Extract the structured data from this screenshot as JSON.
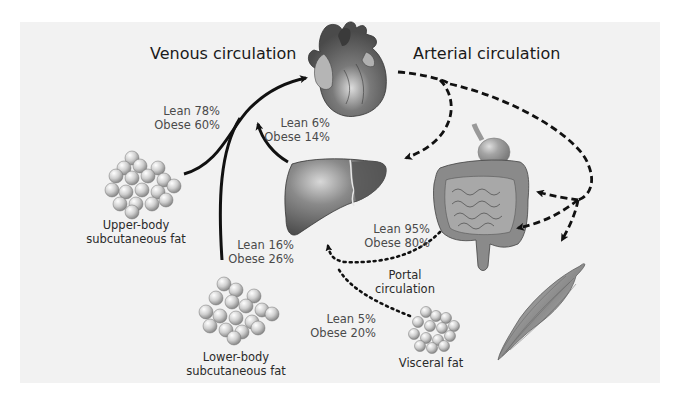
{
  "titles": {
    "venous": "Venous circulation",
    "arterial": "Arterial circulation"
  },
  "organs": {
    "heart": "heart",
    "liver": "liver",
    "gut": "stomach and intestines",
    "muscle": "skeletal muscle"
  },
  "depots": {
    "upper": {
      "line1": "Upper-body",
      "line2": "subcutaneous fat"
    },
    "lower": {
      "line1": "Lower-body",
      "line2": "subcutaneous fat"
    },
    "visceral": {
      "line1": "Visceral fat"
    }
  },
  "flows": {
    "upper_to_heart": {
      "lean": "Lean 78%",
      "obese": "Obese 60%"
    },
    "liver_to_heart": {
      "lean": "Lean 6%",
      "obese": "Obese 14%"
    },
    "lower_to_heart": {
      "lean": "Lean 16%",
      "obese": "Obese 26%"
    },
    "gut_to_liver": {
      "lean": "Lean 95%",
      "obese": "Obese 80%"
    },
    "visceral_to_liver": {
      "lean": "Lean 5%",
      "obese": "Obese 20%"
    }
  },
  "portal": {
    "line1": "Portal",
    "line2": "circulation"
  },
  "colors": {
    "background": "#f2f2f2",
    "arrow": "#111111",
    "organ": "#7d7d7d",
    "fat": "#d4d4d4"
  }
}
